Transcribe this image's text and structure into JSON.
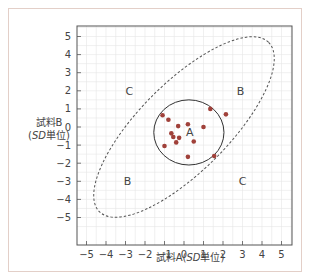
{
  "chart_data": {
    "type": "scatter",
    "title": "",
    "xlabel": "試料A(SD単位)",
    "ylabel": "試料B(SD単位)",
    "xlim": [
      -5,
      5
    ],
    "ylim": [
      -5,
      5
    ],
    "xticks": [
      -5,
      -4,
      -3,
      -2,
      -1,
      0,
      1,
      2,
      3,
      4,
      5
    ],
    "yticks": [
      -5,
      -4,
      -3,
      -2,
      -1,
      0,
      1,
      2,
      3,
      4,
      5
    ],
    "grid": true,
    "series": [
      {
        "name": "points",
        "color": "#a0413a",
        "points": [
          [
            -1.1,
            0.65
          ],
          [
            -0.8,
            0.4
          ],
          [
            -0.3,
            0.05
          ],
          [
            0.2,
            0.15
          ],
          [
            1.0,
            0.0
          ],
          [
            1.35,
            1.0
          ],
          [
            2.15,
            0.7
          ],
          [
            -0.65,
            -0.35
          ],
          [
            -0.55,
            -0.55
          ],
          [
            -0.25,
            -0.6
          ],
          [
            -0.4,
            -0.85
          ],
          [
            0.5,
            -0.8
          ],
          [
            -1.0,
            -1.05
          ],
          [
            0.2,
            -1.65
          ],
          [
            1.55,
            -1.6
          ]
        ]
      }
    ],
    "annotations": [
      {
        "text": "A",
        "x": 0.3,
        "y": -0.3
      },
      {
        "text": "B",
        "x": 2.9,
        "y": 2.0
      },
      {
        "text": "B",
        "x": -2.9,
        "y": -3.0
      },
      {
        "text": "C",
        "x": -2.8,
        "y": 2.0
      },
      {
        "text": "C",
        "x": 3.0,
        "y": -3.0
      }
    ],
    "shapes": [
      {
        "type": "circle",
        "style": "solid",
        "center": [
          0.25,
          -0.3
        ],
        "radius": 1.8
      },
      {
        "type": "ellipse",
        "style": "dashed",
        "center": [
          0.0,
          0.0
        ],
        "angle_deg": 45,
        "semi_major": 6.3,
        "semi_minor": 2.4
      }
    ]
  },
  "labels": {
    "ylabel_line1": "試料B",
    "ylabel_sd": "SD",
    "ylabel_unit": "単位)",
    "ylabel_open": "(",
    "xlabel_prefix": "試料A(",
    "xlabel_sd": "SD",
    "xlabel_suffix": "単位)"
  }
}
